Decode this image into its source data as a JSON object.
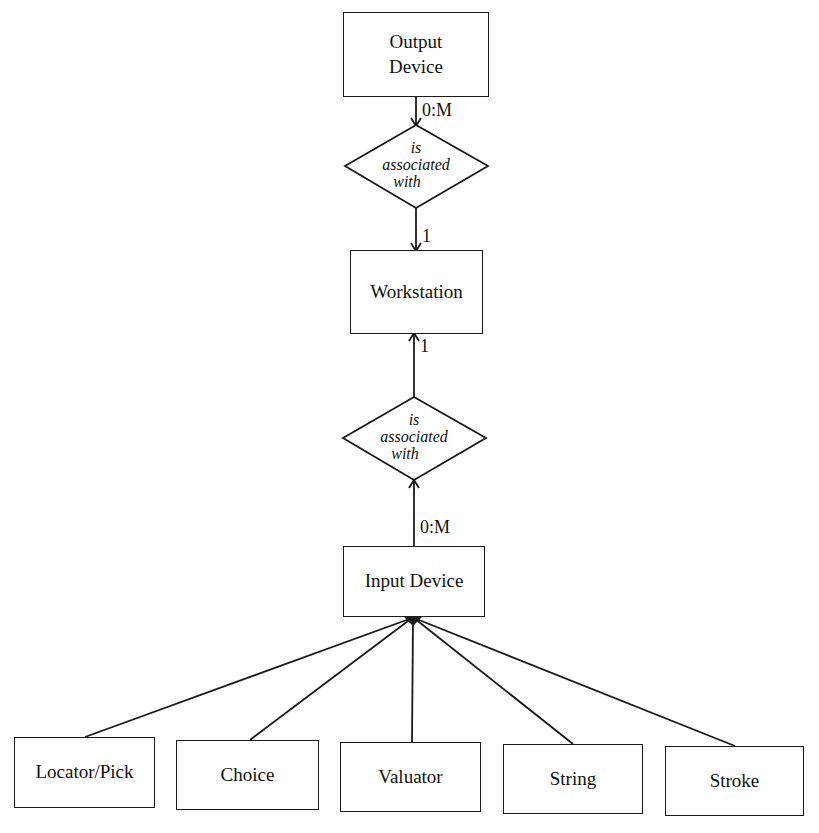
{
  "diagram": {
    "type": "entity-relationship",
    "entities": {
      "output_device": "Output\nDevice",
      "output_device_line1": "Output",
      "output_device_line2": "Device",
      "workstation": "Workstation",
      "input_device": "Input Device"
    },
    "relationships": [
      {
        "label_line1": "is",
        "label_line2": "associated",
        "label_line3": "with",
        "from": "Output Device",
        "to": "Workstation",
        "cardinality_top": "0:M",
        "cardinality_bottom": "1"
      },
      {
        "label_line1": "is",
        "label_line2": "associated",
        "label_line3": "with",
        "from": "Input Device",
        "to": "Workstation",
        "cardinality_top": "1",
        "cardinality_bottom": "0:M"
      }
    ],
    "subtypes": [
      {
        "label": "Locator/Pick"
      },
      {
        "label": "Choice"
      },
      {
        "label": "Valuator"
      },
      {
        "label": "String"
      },
      {
        "label": "Stroke"
      }
    ],
    "line_color": "#1a1a1a"
  }
}
